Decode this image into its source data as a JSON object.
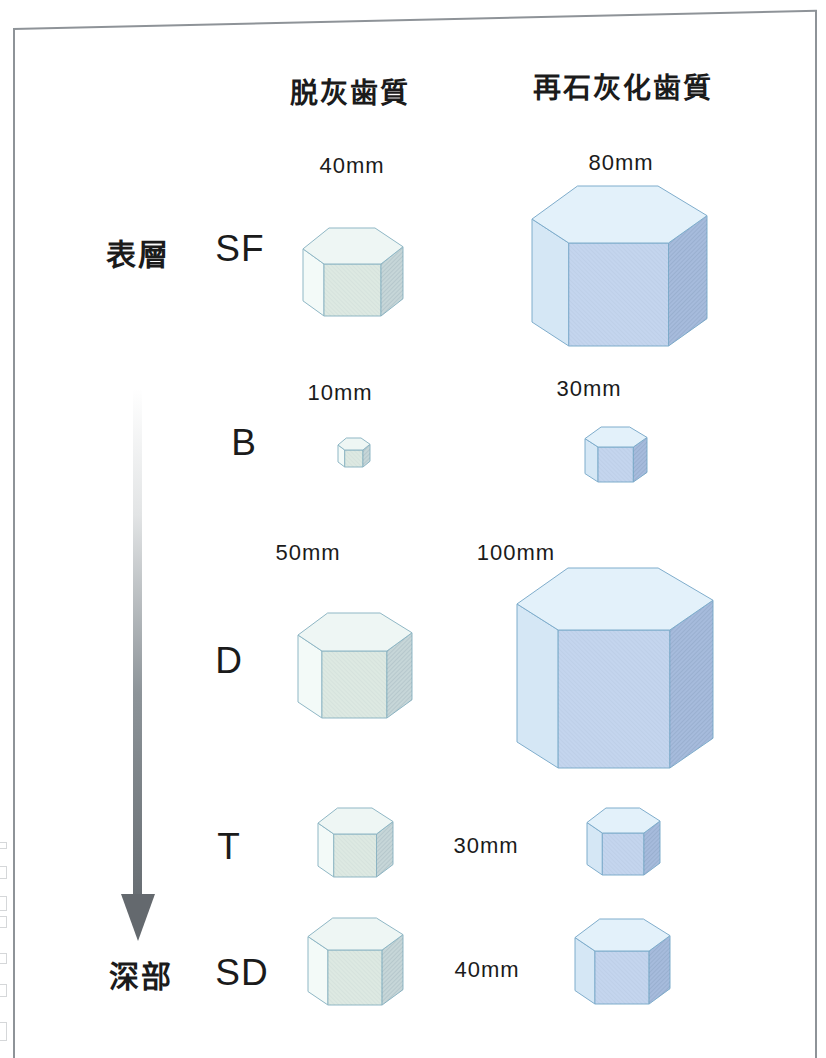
{
  "figure": {
    "columns": [
      {
        "id": "demineralized",
        "header": "脱灰歯質"
      },
      {
        "id": "remineralized",
        "header": "再石灰化歯質"
      }
    ],
    "depth_axis": {
      "top": "表層",
      "bottom": "深部"
    },
    "palettes": {
      "demineralized": {
        "top": "#eef6f4",
        "left": "#f3faf8",
        "front": "#dde9e2",
        "right": "#c6d6d8",
        "stroke": "#8fb7c5"
      },
      "remineralized": {
        "top": "#e3f1fa",
        "left": "#d5e7f5",
        "front": "#c4d5ee",
        "right": "#a6bbdc",
        "stroke": "#7fadcc"
      }
    },
    "rows": [
      {
        "label": "SF",
        "label_pos": {
          "x": 240,
          "y": 249
        },
        "cells": [
          {
            "column": "demineralized",
            "size_mm": 40,
            "size_label": "40mm",
            "size_label_pos": {
              "x": 352,
              "y": 166
            },
            "crystal": {
              "x": 303,
              "y": 228,
              "w": 100,
              "topH": 36,
              "bodyH": 52
            }
          },
          {
            "column": "remineralized",
            "size_mm": 80,
            "size_label": "80mm",
            "size_label_pos": {
              "x": 621,
              "y": 163
            },
            "crystal": {
              "x": 532,
              "y": 186,
              "w": 175,
              "topH": 57,
              "bodyH": 103
            }
          }
        ]
      },
      {
        "label": "B",
        "label_pos": {
          "x": 244,
          "y": 443
        },
        "cells": [
          {
            "column": "demineralized",
            "size_mm": 10,
            "size_label": "10mm",
            "size_label_pos": {
              "x": 340,
              "y": 393
            },
            "crystal": {
              "x": 338,
              "y": 438,
              "w": 32,
              "topH": 12,
              "bodyH": 17
            }
          },
          {
            "column": "remineralized",
            "size_mm": 30,
            "size_label": "30mm",
            "size_label_pos": {
              "x": 589,
              "y": 389
            },
            "crystal": {
              "x": 585,
              "y": 427,
              "w": 62,
              "topH": 20,
              "bodyH": 35
            }
          }
        ]
      },
      {
        "label": "D",
        "label_pos": {
          "x": 229,
          "y": 661
        },
        "cells": [
          {
            "column": "demineralized",
            "size_mm": 50,
            "size_label": "50mm",
            "size_label_pos": {
              "x": 308,
              "y": 553
            },
            "crystal": {
              "x": 298,
              "y": 613,
              "w": 114,
              "topH": 38,
              "bodyH": 67
            }
          },
          {
            "column": "remineralized",
            "size_mm": 100,
            "size_label": "100mm",
            "size_label_pos": {
              "x": 516,
              "y": 553
            },
            "crystal": {
              "x": 517,
              "y": 568,
              "w": 196,
              "topH": 62,
              "bodyH": 138
            }
          }
        ]
      },
      {
        "label": "T",
        "label_pos": {
          "x": 229,
          "y": 847
        },
        "shared_size_mm": 30,
        "shared_size_label": "30mm",
        "shared_size_pos": {
          "x": 486,
          "y": 846
        },
        "cells": [
          {
            "column": "demineralized",
            "size_mm": 30,
            "crystal": {
              "x": 318,
              "y": 808,
              "w": 75,
              "topH": 26,
              "bodyH": 43
            }
          },
          {
            "column": "remineralized",
            "size_mm": 30,
            "crystal": {
              "x": 587,
              "y": 808,
              "w": 73,
              "topH": 25,
              "bodyH": 42
            }
          }
        ]
      },
      {
        "label": "SD",
        "label_pos": {
          "x": 242,
          "y": 973
        },
        "shared_size_mm": 40,
        "shared_size_label": "40mm",
        "shared_size_pos": {
          "x": 487,
          "y": 970
        },
        "cells": [
          {
            "column": "demineralized",
            "size_mm": 40,
            "crystal": {
              "x": 308,
              "y": 918,
              "w": 95,
              "topH": 32,
              "bodyH": 55
            }
          },
          {
            "column": "remineralized",
            "size_mm": 40,
            "crystal": {
              "x": 575,
              "y": 919,
              "w": 95,
              "topH": 32,
              "bodyH": 53
            }
          }
        ]
      }
    ]
  },
  "chart_data": {
    "type": "table",
    "title": "",
    "columns": [
      "脱灰歯質",
      "再石灰化歯質"
    ],
    "depth_order_top_to_bottom": [
      "表層",
      "深部"
    ],
    "rows": [
      {
        "layer": "SF",
        "demineralized_mm": 40,
        "remineralized_mm": 80
      },
      {
        "layer": "B",
        "demineralized_mm": 10,
        "remineralized_mm": 30
      },
      {
        "layer": "D",
        "demineralized_mm": 50,
        "remineralized_mm": 100
      },
      {
        "layer": "T",
        "demineralized_mm": 30,
        "remineralized_mm": 30
      },
      {
        "layer": "SD",
        "demineralized_mm": 40,
        "remineralized_mm": 40
      }
    ]
  }
}
